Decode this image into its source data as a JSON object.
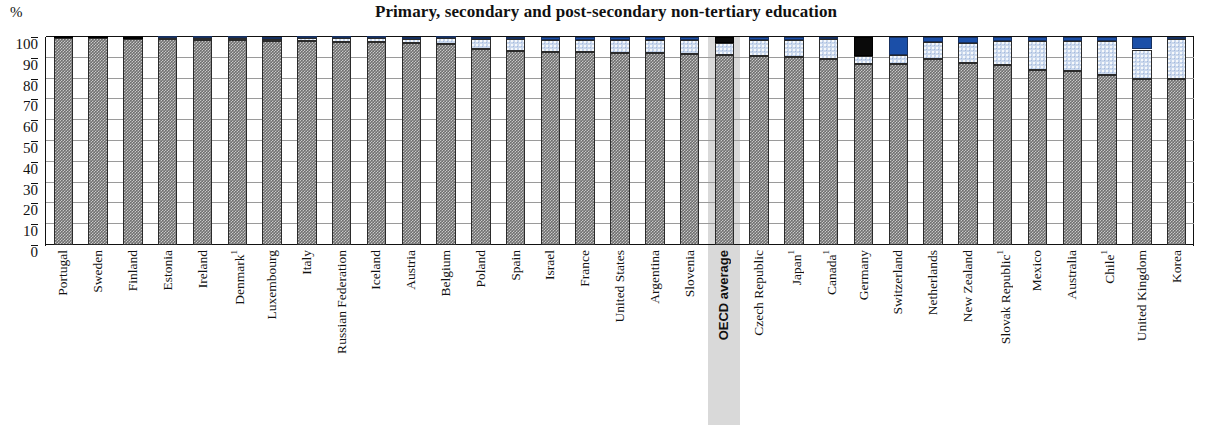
{
  "chart_data": {
    "type": "bar",
    "subtype": "stacked-bar-100",
    "title": "Primary, secondary and post-secondary non-tertiary education",
    "xlabel": "",
    "ylabel": "%",
    "ylim": [
      0,
      100
    ],
    "yticks": [
      0,
      10,
      20,
      30,
      40,
      50,
      60,
      70,
      80,
      90,
      100
    ],
    "ytick_labels": [
      "0",
      "10",
      "20",
      "30",
      "40",
      "50",
      "60",
      "70",
      "80",
      "90",
      "100"
    ],
    "grid": true,
    "legend": null,
    "legend_position": "none",
    "highlight_category": "OECD average",
    "categories": [
      "Portugal",
      "Sweden",
      "Finland",
      "Estonia",
      "Ireland",
      "Denmark¹",
      "Luxembourg",
      "Italy",
      "Russian Federation",
      "Iceland",
      "Austria",
      "Belgium",
      "Poland",
      "Spain",
      "Israel",
      "France",
      "United States",
      "Argentina",
      "Slovenia",
      "OECD average",
      "Czech Republic",
      "Japan¹",
      "Canada¹",
      "Germany",
      "Switzerland",
      "Netherlands",
      "New Zealand",
      "Slovak Republic¹",
      "Mexico",
      "Australia",
      "Chile¹",
      "United Kingdom",
      "Korea"
    ],
    "category_footnotes": {
      "Denmark¹": "1",
      "Japan¹": "1",
      "Canada¹": "1",
      "Slovak Republic¹": "1",
      "Chile¹": "1"
    },
    "series": [
      {
        "name": "lower-segment",
        "color": "#6f6f6f",
        "pattern": "dense-hatch",
        "values": [
          99.5,
          99.5,
          99.0,
          99.0,
          98.5,
          98.5,
          98.0,
          98.0,
          97.5,
          97.5,
          97.0,
          96.5,
          94.0,
          93.5,
          93.0,
          93.0,
          92.5,
          92.5,
          92.0,
          91.5,
          91.0,
          90.5,
          89.5,
          87.0,
          87.0,
          89.5,
          87.5,
          86.5,
          84.0,
          83.5,
          81.5,
          80.0,
          80.0
        ]
      },
      {
        "name": "middle-segment",
        "color": "#c9d7ec",
        "pattern": "speckled",
        "values": [
          0.0,
          0.0,
          0.0,
          0.5,
          1.0,
          1.0,
          1.2,
          1.5,
          1.8,
          2.0,
          2.2,
          2.8,
          5.0,
          5.5,
          5.5,
          5.5,
          6.0,
          6.0,
          6.5,
          5.5,
          7.5,
          8.0,
          9.5,
          4.0,
          4.5,
          8.0,
          9.5,
          11.5,
          14.0,
          14.5,
          16.5,
          14.0,
          19.0
        ]
      },
      {
        "name": "upper-segment",
        "color": "#1b4fa8",
        "pattern": "solid",
        "values": [
          0.5,
          0.5,
          1.0,
          0.5,
          0.5,
          0.5,
          0.8,
          0.5,
          0.7,
          0.5,
          0.8,
          0.7,
          1.0,
          1.0,
          1.5,
          1.5,
          1.5,
          1.5,
          1.5,
          3.0,
          1.5,
          1.5,
          1.0,
          9.0,
          8.5,
          2.5,
          3.0,
          2.0,
          2.0,
          2.0,
          2.0,
          6.0,
          1.0
        ]
      }
    ],
    "black_capped_categories": [
      "Portugal",
      "Sweden",
      "Finland",
      "OECD average",
      "Germany"
    ]
  },
  "axis": {
    "y_unit_label": "%"
  }
}
